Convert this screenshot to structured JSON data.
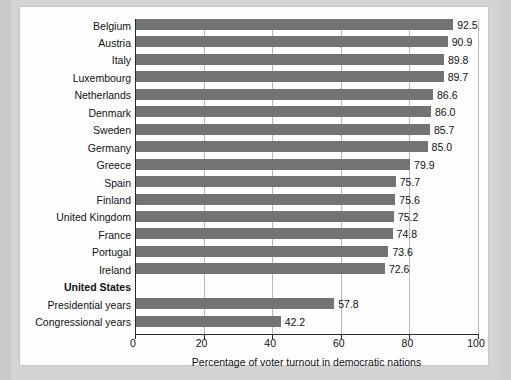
{
  "chart_data": {
    "type": "bar",
    "orientation": "horizontal",
    "title": "",
    "xlabel": "Percentage of voter turnout in democratic nations",
    "ylabel": "",
    "xlim": [
      0,
      100
    ],
    "xticks": [
      0,
      20,
      40,
      60,
      80,
      100
    ],
    "xtick_labels": [
      "0",
      "20",
      "40",
      "60",
      "80",
      "100"
    ],
    "grid": true,
    "grid_axis": "x",
    "legend": "none",
    "bar_color": "#737373",
    "categories": [
      "Belgium",
      "Austria",
      "Italy",
      "Luxembourg",
      "Netherlands",
      "Denmark",
      "Sweden",
      "Germany",
      "Greece",
      "Spain",
      "Finland",
      "United Kingdom",
      "France",
      "Portugal",
      "Ireland",
      "United States",
      "Presidential years",
      "Congressional years"
    ],
    "values": [
      92.5,
      90.9,
      89.8,
      89.7,
      86.6,
      86.0,
      85.7,
      85.0,
      79.9,
      75.7,
      75.6,
      75.2,
      74.8,
      73.6,
      72.6,
      null,
      57.8,
      42.2
    ],
    "value_labels": [
      "92.5",
      "90.9",
      "89.8",
      "89.7",
      "86.6",
      "86.0",
      "85.7",
      "85.0",
      "79.9",
      "75.7",
      "75.6",
      "75.2",
      "74.8",
      "73.6",
      "72.6",
      "",
      "57.8",
      "42.2"
    ],
    "category_styles": [
      "normal",
      "normal",
      "normal",
      "normal",
      "normal",
      "normal",
      "normal",
      "normal",
      "normal",
      "normal",
      "normal",
      "normal",
      "normal",
      "normal",
      "normal",
      "bold-header",
      "indented",
      "indented"
    ]
  }
}
